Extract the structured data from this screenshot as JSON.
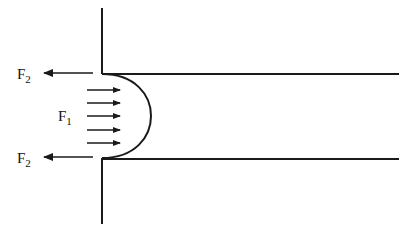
{
  "diagram": {
    "labels": {
      "f2_top": {
        "main": "F",
        "sub": "2"
      },
      "f1": {
        "main": "F",
        "sub": "1"
      },
      "f2_bottom": {
        "main": "F",
        "sub": "2"
      }
    },
    "colors": {
      "stroke": "#1a1a1a",
      "background": "#ffffff"
    },
    "f1_arrow_count": 5
  }
}
